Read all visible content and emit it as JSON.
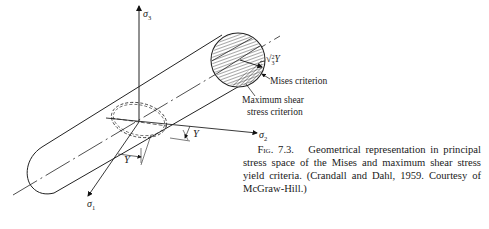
{
  "figure": {
    "axes": {
      "sigma1": {
        "symbol": "σ",
        "sub": "1"
      },
      "sigma2": {
        "symbol": "σ",
        "sub": "2"
      },
      "sigma3": {
        "symbol": "σ",
        "sub": "3"
      }
    },
    "labels": {
      "radius": "√(2/3) Y",
      "radius_sqrt": "√",
      "radius_frac_num": "2",
      "radius_frac_den": "3",
      "radius_var": "Y",
      "mises": "Mises criterion",
      "max_shear_line1": "Maximum shear",
      "max_shear_line2": "stress criterion",
      "y_upper": "Y",
      "y_lower": "Y"
    }
  },
  "caption": {
    "lead": "Fig. 7.3.",
    "text": "Geometrical representation in principal stress space of the Mises and maximum shear stress yield criteria. (Crandall and Dahl, 1959. Courtesy of McGraw-Hill.)"
  }
}
